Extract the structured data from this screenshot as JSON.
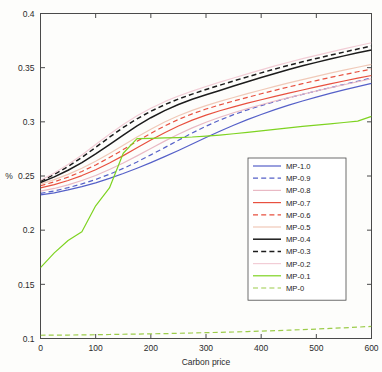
{
  "chart_data": {
    "type": "line",
    "title": "",
    "xlabel": "Carbon price",
    "ylabel": "%",
    "xlim": [
      0,
      600
    ],
    "ylim": [
      0.1,
      0.4
    ],
    "xticks": [
      0,
      100,
      200,
      300,
      400,
      500,
      600
    ],
    "xticklabels": [
      "0",
      "100",
      "200",
      "300",
      "400",
      "500",
      "600"
    ],
    "yticks": [
      0.1,
      0.15,
      0.2,
      0.25,
      0.3,
      0.35,
      0.4
    ],
    "yticklabels": [
      "0.1",
      "0.15",
      "0.2",
      "0.25",
      "0.3",
      "0.35",
      "0.4"
    ],
    "grid": false,
    "legend_position": "center-right",
    "x": [
      0,
      25,
      50,
      75,
      100,
      125,
      150,
      175,
      200,
      225,
      250,
      275,
      300,
      325,
      350,
      375,
      400,
      425,
      450,
      475,
      500,
      525,
      550,
      575,
      600
    ],
    "series": [
      {
        "name": "MP-1.0",
        "color": "#5560c8",
        "style": "solid",
        "values": [
          0.2325,
          0.2345,
          0.2372,
          0.2402,
          0.2437,
          0.2478,
          0.2523,
          0.2572,
          0.2624,
          0.2679,
          0.2736,
          0.2795,
          0.2855,
          0.2913,
          0.2968,
          0.302,
          0.3068,
          0.3113,
          0.3154,
          0.3192,
          0.3228,
          0.3262,
          0.3295,
          0.3325,
          0.3355
        ]
      },
      {
        "name": "MP-0.9",
        "color": "#5560c8",
        "style": "dashed",
        "values": [
          0.234,
          0.2362,
          0.2392,
          0.2427,
          0.2468,
          0.2516,
          0.257,
          0.263,
          0.2695,
          0.2762,
          0.283,
          0.2897,
          0.296,
          0.3016,
          0.3066,
          0.311,
          0.315,
          0.3187,
          0.3222,
          0.3254,
          0.3285,
          0.3315,
          0.3345,
          0.3375,
          0.3405
        ]
      },
      {
        "name": "MP-0.8",
        "color": "#e9b9c4",
        "style": "solid",
        "values": [
          0.236,
          0.2385,
          0.2418,
          0.2458,
          0.2505,
          0.256,
          0.262,
          0.2686,
          0.2754,
          0.2822,
          0.2886,
          0.2944,
          0.2996,
          0.3042,
          0.3084,
          0.3122,
          0.3158,
          0.3192,
          0.3224,
          0.3255,
          0.3285,
          0.3314,
          0.3342,
          0.337,
          0.3398
        ]
      },
      {
        "name": "MP-0.7",
        "color": "#e8503f",
        "style": "solid",
        "values": [
          0.239,
          0.242,
          0.2458,
          0.2504,
          0.2558,
          0.262,
          0.2688,
          0.276,
          0.2832,
          0.29,
          0.2962,
          0.3016,
          0.3062,
          0.3102,
          0.3138,
          0.3172,
          0.3204,
          0.3235,
          0.3265,
          0.3294,
          0.3322,
          0.335,
          0.3377,
          0.3403,
          0.3428
        ]
      },
      {
        "name": "MP-0.6",
        "color": "#e8503f",
        "style": "dashed",
        "values": [
          0.241,
          0.2446,
          0.249,
          0.2542,
          0.2602,
          0.267,
          0.2744,
          0.282,
          0.2894,
          0.2962,
          0.3022,
          0.3074,
          0.3118,
          0.3156,
          0.3192,
          0.3226,
          0.3259,
          0.3291,
          0.3322,
          0.3352,
          0.3381,
          0.3409,
          0.3436,
          0.3462,
          0.3487
        ]
      },
      {
        "name": "MP-0.5",
        "color": "#f0c9b8",
        "style": "solid",
        "values": [
          0.2425,
          0.2466,
          0.2515,
          0.2572,
          0.2637,
          0.2708,
          0.2784,
          0.286,
          0.2932,
          0.2998,
          0.3056,
          0.3106,
          0.315,
          0.3189,
          0.3225,
          0.326,
          0.3294,
          0.3327,
          0.3359,
          0.339,
          0.342,
          0.3449,
          0.3477,
          0.3504,
          0.353
        ]
      },
      {
        "name": "MP-0.4",
        "color": "#1c1c1c",
        "style": "solid",
        "values": [
          0.244,
          0.2492,
          0.2553,
          0.2624,
          0.2704,
          0.279,
          0.2878,
          0.2962,
          0.3038,
          0.3104,
          0.316,
          0.3208,
          0.325,
          0.329,
          0.333,
          0.337,
          0.3409,
          0.3447,
          0.3483,
          0.3517,
          0.3549,
          0.358,
          0.3609,
          0.3637,
          0.3664
        ]
      },
      {
        "name": "MP-0.3",
        "color": "#1c1c1c",
        "style": "dashed",
        "values": [
          0.2452,
          0.2515,
          0.2588,
          0.2672,
          0.2764,
          0.2858,
          0.2948,
          0.3028,
          0.3098,
          0.3158,
          0.321,
          0.3256,
          0.3298,
          0.3338,
          0.3377,
          0.3415,
          0.3452,
          0.3488,
          0.3522,
          0.3554,
          0.3585,
          0.3615,
          0.3644,
          0.3672,
          0.37
        ]
      },
      {
        "name": "MP-0.2",
        "color": "#f2cdd6",
        "style": "solid",
        "values": [
          0.246,
          0.2528,
          0.2606,
          0.2694,
          0.279,
          0.2886,
          0.2976,
          0.3056,
          0.3126,
          0.3186,
          0.3238,
          0.3284,
          0.3326,
          0.3366,
          0.3405,
          0.3443,
          0.348,
          0.3516,
          0.355,
          0.3583,
          0.3614,
          0.3644,
          0.3673,
          0.3702,
          0.373
        ]
      },
      {
        "name": "MP-0.1",
        "color": "#7ed321",
        "style": "solid",
        "values": [
          0.1655,
          0.179,
          0.1905,
          0.1985,
          0.2225,
          0.239,
          0.271,
          0.2845,
          0.2848,
          0.2851,
          0.2855,
          0.286,
          0.2868,
          0.2878,
          0.289,
          0.2903,
          0.2917,
          0.2931,
          0.2945,
          0.2958,
          0.297,
          0.2982,
          0.2994,
          0.3006,
          0.305
        ]
      },
      {
        "name": "MP-0",
        "color": "#9ccc4a",
        "style": "dashed",
        "values": [
          0.103,
          0.1031,
          0.1032,
          0.1033,
          0.1035,
          0.1037,
          0.1039,
          0.1041,
          0.1043,
          0.1045,
          0.1048,
          0.1051,
          0.1054,
          0.1057,
          0.106,
          0.1064,
          0.1068,
          0.1072,
          0.1077,
          0.1082,
          0.1087,
          0.1093,
          0.1099,
          0.1105,
          0.1112
        ]
      }
    ]
  },
  "legend": {
    "entries": [
      {
        "label": "MP-1.0"
      },
      {
        "label": "MP-0.9"
      },
      {
        "label": "MP-0.8"
      },
      {
        "label": "MP-0.7"
      },
      {
        "label": "MP-0.6"
      },
      {
        "label": "MP-0.5"
      },
      {
        "label": "MP-0.4"
      },
      {
        "label": "MP-0.3"
      },
      {
        "label": "MP-0.2"
      },
      {
        "label": "MP-0.1"
      },
      {
        "label": "MP-0"
      }
    ]
  }
}
